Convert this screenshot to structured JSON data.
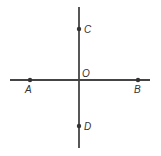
{
  "diagram": {
    "type": "perpendicular-lines",
    "line_color": "#444444",
    "point_color": "#333333",
    "horizontal_line": {
      "x1": 10,
      "y1": 80,
      "x2": 150,
      "y2": 80
    },
    "vertical_line": {
      "x1": 79,
      "y1": 7,
      "x2": 79,
      "y2": 148
    },
    "points": [
      {
        "name": "A",
        "label": "A",
        "x": 30,
        "y": 80,
        "lx": 25,
        "ly": 93
      },
      {
        "name": "B",
        "label": "B",
        "x": 138,
        "y": 80,
        "lx": 134,
        "ly": 93
      },
      {
        "name": "C",
        "label": "C",
        "x": 79,
        "y": 29,
        "lx": 84,
        "ly": 33
      },
      {
        "name": "D",
        "label": "D",
        "x": 79,
        "y": 126,
        "lx": 84,
        "ly": 130
      },
      {
        "name": "O",
        "label": "O",
        "x": 79,
        "y": 80,
        "lx": 82,
        "ly": 77,
        "dot": false
      }
    ]
  }
}
